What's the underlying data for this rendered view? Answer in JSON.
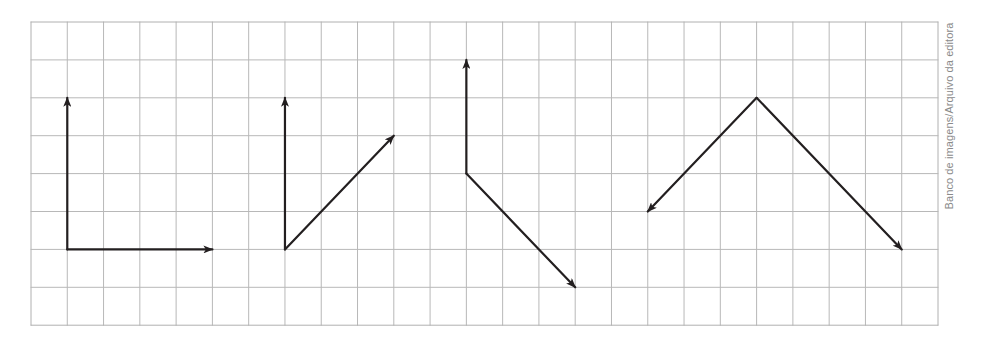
{
  "credit": "Banco de imagens/Arquivo da editora",
  "grid": {
    "origin_x": 31,
    "origin_y": 22,
    "cell_w": 36.28,
    "cell_h": 37.9,
    "cols": 25,
    "rows": 8,
    "line_color": "#b8b8b8",
    "border_color": "#b0b0b0"
  },
  "arrow_color": "#231f20",
  "figures": [
    {
      "name": "figure-1",
      "origin": [
        1,
        6
      ],
      "vectors": [
        {
          "to": [
            1,
            2
          ],
          "direction": "up",
          "length_units": 4
        },
        {
          "to": [
            5,
            6
          ],
          "direction": "right",
          "length_units": 4
        }
      ]
    },
    {
      "name": "figure-2",
      "origin": [
        7,
        6
      ],
      "vectors": [
        {
          "to": [
            7,
            2
          ],
          "direction": "up",
          "length_units": 4
        },
        {
          "to": [
            10,
            3
          ],
          "direction": "up-right",
          "dx": 3,
          "dy": -3
        }
      ]
    },
    {
      "name": "figure-3",
      "origin": [
        12,
        4
      ],
      "vectors": [
        {
          "to": [
            12,
            1
          ],
          "direction": "up",
          "length_units": 3
        },
        {
          "to": [
            15,
            7
          ],
          "direction": "down-right",
          "dx": 3,
          "dy": 3
        }
      ]
    },
    {
      "name": "figure-4",
      "origin": [
        20,
        2
      ],
      "vectors": [
        {
          "to": [
            17,
            5
          ],
          "direction": "down-left",
          "dx": -3,
          "dy": 3
        },
        {
          "to": [
            24,
            6
          ],
          "direction": "down-right",
          "dx": 4,
          "dy": 4
        }
      ]
    }
  ]
}
